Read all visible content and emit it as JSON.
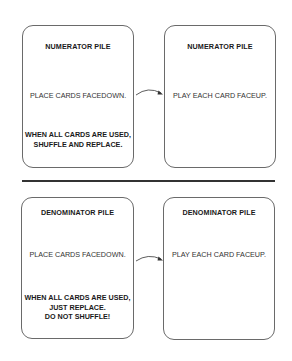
{
  "sections": [
    {
      "name": "numerator",
      "left_card": {
        "title": "NUMERATOR PILE",
        "instruction": "PLACE CARDS FACEDOWN.",
        "note_lines": [
          "WHEN ALL CARDS ARE USED,",
          "SHUFFLE AND REPLACE."
        ]
      },
      "right_card": {
        "title": "NUMERATOR PILE",
        "instruction": "PLAY EACH CARD FACEUP."
      }
    },
    {
      "name": "denominator",
      "left_card": {
        "title": "DENOMINATOR PILE",
        "instruction": "PLACE CARDS FACEDOWN.",
        "note_lines": [
          "WHEN ALL CARDS ARE USED,",
          "JUST REPLACE.",
          "DO NOT SHUFFLE!"
        ]
      },
      "right_card": {
        "title": "DENOMINATOR PILE",
        "instruction": "PLAY EACH CARD FACEUP."
      }
    }
  ],
  "colors": {
    "border": "#6a6a6a",
    "divider": "#333333",
    "text": "#1a1a1a"
  }
}
